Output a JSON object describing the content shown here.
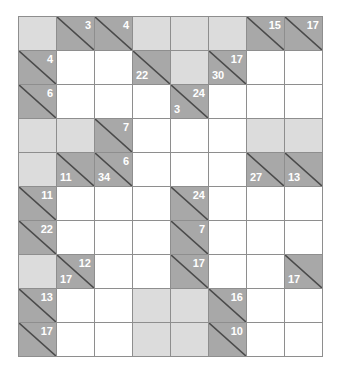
{
  "puzzle": {
    "name": "kakuro-puzzle",
    "type": "kakuro",
    "columns": 8,
    "rows": 10,
    "colors": {
      "open_cell": "#ffffff",
      "block_cell": "#dcdcdc",
      "clue_cell": "#a8a8a8",
      "grid_line": "#8e8e8e",
      "diagonal_line": "#4a4a4a",
      "clue_text": "#ffffff",
      "background": "#ffffff"
    },
    "legend": {
      "down_clue_position": "upper-right",
      "across_clue_position": "lower-left"
    },
    "cells": [
      [
        {
          "kind": "block"
        },
        {
          "kind": "clue",
          "down": "3"
        },
        {
          "kind": "clue",
          "down": "4"
        },
        {
          "kind": "block"
        },
        {
          "kind": "block"
        },
        {
          "kind": "block"
        },
        {
          "kind": "clue",
          "down": "15"
        },
        {
          "kind": "clue",
          "down": "17"
        }
      ],
      [
        {
          "kind": "clue",
          "down": "4"
        },
        {
          "kind": "open"
        },
        {
          "kind": "open"
        },
        {
          "kind": "clue",
          "across": "22"
        },
        {
          "kind": "block"
        },
        {
          "kind": "clue",
          "across": "30",
          "down": "17"
        },
        {
          "kind": "open"
        },
        {
          "kind": "open"
        }
      ],
      [
        {
          "kind": "clue",
          "down": "6"
        },
        {
          "kind": "open"
        },
        {
          "kind": "open"
        },
        {
          "kind": "open"
        },
        {
          "kind": "clue",
          "across": "3",
          "down": "24"
        },
        {
          "kind": "open"
        },
        {
          "kind": "open"
        },
        {
          "kind": "open"
        }
      ],
      [
        {
          "kind": "block"
        },
        {
          "kind": "block"
        },
        {
          "kind": "clue",
          "down": "7"
        },
        {
          "kind": "open"
        },
        {
          "kind": "open"
        },
        {
          "kind": "open"
        },
        {
          "kind": "block"
        },
        {
          "kind": "block"
        }
      ],
      [
        {
          "kind": "block"
        },
        {
          "kind": "clue",
          "across": "11"
        },
        {
          "kind": "clue",
          "across": "34",
          "down": "6"
        },
        {
          "kind": "open"
        },
        {
          "kind": "open"
        },
        {
          "kind": "open"
        },
        {
          "kind": "clue",
          "across": "27"
        },
        {
          "kind": "clue",
          "across": "13"
        }
      ],
      [
        {
          "kind": "clue",
          "down": "11"
        },
        {
          "kind": "open"
        },
        {
          "kind": "open"
        },
        {
          "kind": "open"
        },
        {
          "kind": "clue",
          "down": "24"
        },
        {
          "kind": "open"
        },
        {
          "kind": "open"
        },
        {
          "kind": "open"
        }
      ],
      [
        {
          "kind": "clue",
          "down": "22"
        },
        {
          "kind": "open"
        },
        {
          "kind": "open"
        },
        {
          "kind": "open"
        },
        {
          "kind": "clue",
          "down": "7"
        },
        {
          "kind": "open"
        },
        {
          "kind": "open"
        },
        {
          "kind": "open"
        }
      ],
      [
        {
          "kind": "block"
        },
        {
          "kind": "clue",
          "across": "17",
          "down": "12"
        },
        {
          "kind": "open"
        },
        {
          "kind": "open"
        },
        {
          "kind": "clue",
          "down": "17"
        },
        {
          "kind": "open"
        },
        {
          "kind": "open"
        },
        {
          "kind": "clue",
          "across": "17"
        }
      ],
      [
        {
          "kind": "clue",
          "down": "13"
        },
        {
          "kind": "open"
        },
        {
          "kind": "open"
        },
        {
          "kind": "block"
        },
        {
          "kind": "block"
        },
        {
          "kind": "clue",
          "down": "16"
        },
        {
          "kind": "open"
        },
        {
          "kind": "open"
        }
      ],
      [
        {
          "kind": "clue",
          "down": "17"
        },
        {
          "kind": "open"
        },
        {
          "kind": "open"
        },
        {
          "kind": "block"
        },
        {
          "kind": "block"
        },
        {
          "kind": "clue",
          "down": "10"
        },
        {
          "kind": "open"
        },
        {
          "kind": "open"
        }
      ]
    ]
  }
}
